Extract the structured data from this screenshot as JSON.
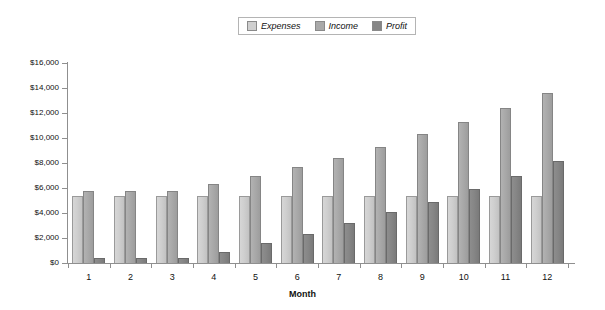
{
  "chart_data": {
    "type": "bar",
    "title": "",
    "subtitle": "",
    "xlabel": "Month",
    "ylabel": "",
    "categories": [
      "1",
      "2",
      "3",
      "4",
      "5",
      "6",
      "7",
      "8",
      "9",
      "10",
      "11",
      "12"
    ],
    "series": [
      {
        "name": "Expenses",
        "color": "#cfcfcf",
        "values": [
          5400,
          5400,
          5400,
          5400,
          5400,
          5400,
          5400,
          5400,
          5400,
          5400,
          5400,
          5400
        ]
      },
      {
        "name": "Income",
        "color": "#a9a9a9",
        "values": [
          5800,
          5800,
          5800,
          6300,
          7000,
          7700,
          8400,
          9300,
          10300,
          11300,
          12400,
          13600
        ]
      },
      {
        "name": "Profit",
        "color": "#868686",
        "values": [
          400,
          400,
          400,
          900,
          1600,
          2300,
          3200,
          4100,
          4900,
          5900,
          7000,
          8200
        ]
      }
    ],
    "ylim": [
      0,
      16000
    ],
    "ytick_values": [
      0,
      2000,
      4000,
      6000,
      8000,
      10000,
      12000,
      14000,
      16000
    ],
    "ytick_labels": [
      "$0",
      "$2,000",
      "$4,000",
      "$6,000",
      "$8,000",
      "$10,000",
      "$12,000",
      "$14,000",
      "$16,000"
    ],
    "grid": false,
    "legend_position": "top-center"
  },
  "legend": {
    "entries": [
      {
        "label": "Expenses"
      },
      {
        "label": "Income"
      },
      {
        "label": "Profit"
      }
    ]
  },
  "axes": {
    "x_title": "Month"
  }
}
